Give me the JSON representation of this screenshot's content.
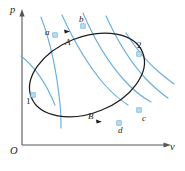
{
  "figure": {
    "kind": "pv-cycle-diagram",
    "axes": {
      "y_label": "p",
      "x_label": "v",
      "origin_label": "O",
      "y_axis_name": "pressure-axis",
      "x_axis_name": "volume-axis"
    },
    "state_points": [
      {
        "id": "1",
        "label": "1",
        "x": 33,
        "y": 95,
        "label_x": 26,
        "label_y": 97,
        "marker": true
      },
      {
        "id": "2",
        "label": "2",
        "x": 139,
        "y": 54,
        "label_x": 137,
        "label_y": 41,
        "marker": true
      },
      {
        "id": "a",
        "label": "a",
        "x": 55,
        "y": 35,
        "label_x": 45,
        "label_y": 28,
        "marker": true
      },
      {
        "id": "b",
        "label": "b",
        "x": 83,
        "y": 26,
        "label_x": 79,
        "label_y": 15,
        "marker": true
      },
      {
        "id": "c",
        "label": "c",
        "x": 139,
        "y": 110,
        "label_x": 142,
        "label_y": 114,
        "marker": true
      },
      {
        "id": "d",
        "label": "d",
        "x": 119,
        "y": 123,
        "label_x": 118,
        "label_y": 126,
        "marker": true
      }
    ],
    "process_labels": [
      {
        "id": "A",
        "label": "A",
        "x": 65,
        "y": 38
      },
      {
        "id": "B",
        "label": "B",
        "x": 88,
        "y": 112
      }
    ],
    "colors": {
      "isotherm": "#6aaede",
      "cycle": "#1d1d1f",
      "axis": "#56565a",
      "node_fill": "#bcdcf0",
      "node_stroke": "#5a9fd0",
      "background": "#ffffff"
    },
    "isotherm_count": 6,
    "direction_arrows": 2,
    "caption": ""
  }
}
